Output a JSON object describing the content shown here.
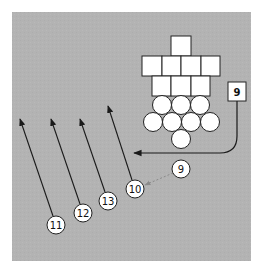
{
  "diagram": {
    "type": "football-play",
    "colors": {
      "field": "#b3b3b3",
      "shape_fill": "#ffffff",
      "stroke": "#222222",
      "dotted": "#8a8a8a"
    },
    "field": {
      "x": 12,
      "y": 12,
      "width": 239,
      "height": 249
    },
    "formation_squares": [
      {
        "x": 171,
        "y": 36,
        "size": 20
      },
      {
        "x": 142,
        "y": 56,
        "size": 20
      },
      {
        "x": 162,
        "y": 56,
        "size": 20
      },
      {
        "x": 181,
        "y": 56,
        "size": 20
      },
      {
        "x": 201,
        "y": 56,
        "size": 20
      },
      {
        "x": 152,
        "y": 76,
        "size": 20
      },
      {
        "x": 171,
        "y": 76,
        "size": 20
      },
      {
        "x": 191,
        "y": 76,
        "size": 20
      }
    ],
    "formation_circles": [
      {
        "cx": 162,
        "cy": 105
      },
      {
        "cx": 181,
        "cy": 105
      },
      {
        "cx": 200,
        "cy": 105
      },
      {
        "cx": 153,
        "cy": 122
      },
      {
        "cx": 172,
        "cy": 122
      },
      {
        "cx": 191,
        "cy": 122
      },
      {
        "cx": 210,
        "cy": 122
      },
      {
        "cx": 181,
        "cy": 139
      }
    ],
    "box_player": {
      "label": "9",
      "x": 228,
      "y": 82,
      "width": 18,
      "height": 19
    },
    "numbered_players": [
      {
        "label": "9",
        "cx": 181,
        "cy": 169
      },
      {
        "label": "10",
        "cx": 135,
        "cy": 189
      },
      {
        "label": "13",
        "cx": 108,
        "cy": 201
      },
      {
        "label": "12",
        "cx": 83,
        "cy": 213
      },
      {
        "label": "11",
        "cx": 56,
        "cy": 225
      }
    ],
    "arrows": [
      {
        "from": "11",
        "x1": 53,
        "y1": 216,
        "x2": 20,
        "y2": 119
      },
      {
        "from": "12",
        "x1": 80,
        "y1": 204,
        "x2": 51,
        "y2": 119
      },
      {
        "from": "13",
        "x1": 105,
        "y1": 192,
        "x2": 80,
        "y2": 119
      },
      {
        "from": "10",
        "x1": 132,
        "y1": 180,
        "x2": 108,
        "y2": 106
      }
    ]
  }
}
